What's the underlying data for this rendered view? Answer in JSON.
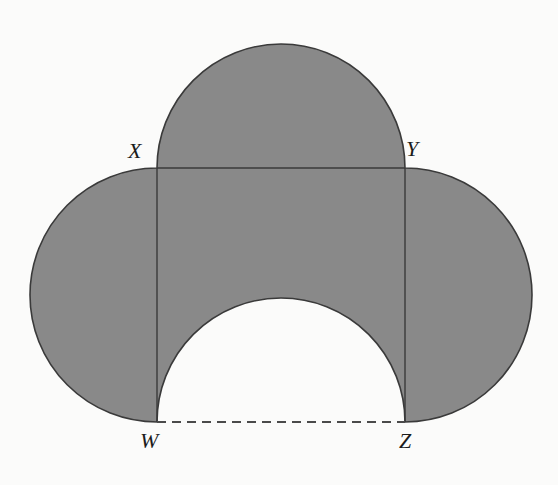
{
  "figure": {
    "background_color": "#fbfbfa",
    "shade_color": "#898989",
    "stroke_color": "#3a3a3a",
    "cutout_color": "#fbfbfa",
    "labels": {
      "X": "X",
      "Y": "Y",
      "W": "W",
      "Z": "Z"
    },
    "vertices": {
      "X": {
        "x": 157,
        "y": 168
      },
      "Y": {
        "x": 405,
        "y": 168
      },
      "W": {
        "x": 157,
        "y": 422
      },
      "Z": {
        "x": 405,
        "y": 422
      }
    },
    "rectangle": {
      "name": "WXYZ",
      "width": 248,
      "height": 254
    },
    "semicircles": [
      {
        "name": "top-semicircle",
        "chord": "XY",
        "direction": "up",
        "shaded": true,
        "center_x": 281,
        "center_y": 168,
        "radius": 124
      },
      {
        "name": "left-semicircle",
        "chord": "XW",
        "direction": "left",
        "shaded": true,
        "center_x": 157,
        "center_y": 295,
        "radius": 127
      },
      {
        "name": "right-semicircle",
        "chord": "YZ",
        "direction": "right",
        "shaded": true,
        "center_x": 405,
        "center_y": 295,
        "radius": 127
      },
      {
        "name": "bottom-semicircle-cutout",
        "chord": "WZ",
        "direction": "up",
        "shaded": false,
        "center_x": 281,
        "center_y": 422,
        "radius": 124
      }
    ],
    "edges": [
      {
        "name": "XY",
        "style": "solid"
      },
      {
        "name": "XW",
        "style": "solid"
      },
      {
        "name": "YZ",
        "style": "solid"
      },
      {
        "name": "WZ",
        "style": "dashed"
      }
    ]
  }
}
